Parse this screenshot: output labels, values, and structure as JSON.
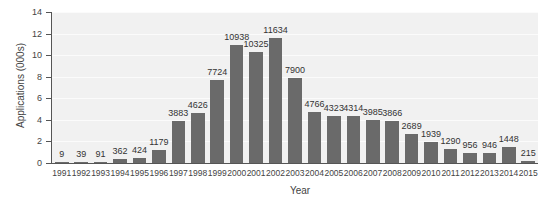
{
  "chart_data": {
    "type": "bar",
    "title": "",
    "xlabel": "Year",
    "ylabel": "Applications (000s)",
    "ylim": [
      0,
      14
    ],
    "yticks": [
      0,
      2,
      4,
      6,
      8,
      10,
      12,
      14
    ],
    "grid": true,
    "legend": null,
    "categories": [
      "1991",
      "1992",
      "1993",
      "1994",
      "1995",
      "1996",
      "1997",
      "1998",
      "1999",
      "2000",
      "2001",
      "2002",
      "2003",
      "2004",
      "2005",
      "2006",
      "2007",
      "2008",
      "2009",
      "2010",
      "2011",
      "2012",
      "2013",
      "2014",
      "2015"
    ],
    "values": [
      9,
      39,
      91,
      362,
      424,
      1179,
      3883,
      4626,
      7724,
      10938,
      10325,
      11634,
      7900,
      4766,
      4323,
      4314,
      3985,
      3866,
      2689,
      1939,
      1290,
      956,
      946,
      1448,
      215
    ],
    "value_labels": [
      "9",
      "39",
      "91",
      "362",
      "424",
      "1179",
      "3883",
      "4626",
      "7724",
      "10938",
      "10325",
      "11634",
      "7900",
      "4766",
      "4323",
      "4314",
      "3985",
      "3866",
      "2689",
      "1939",
      "1290",
      "956",
      "946",
      "1448",
      "215"
    ],
    "bar_color": "#6a6a6a",
    "background_color": "#f1f1f1"
  }
}
